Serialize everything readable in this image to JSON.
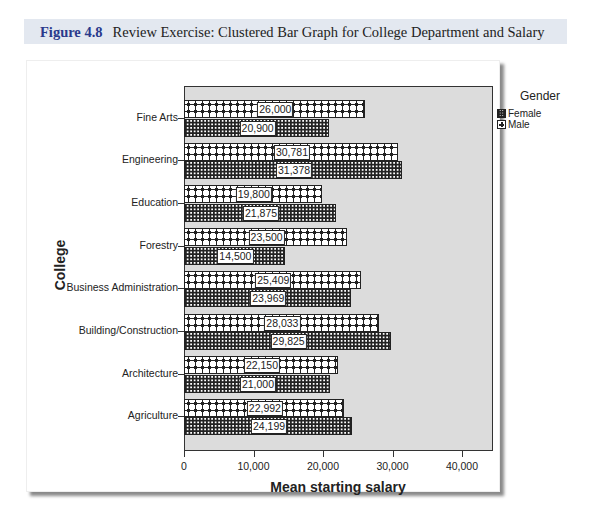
{
  "caption": {
    "figure_label": "Figure 4.8",
    "text": "Review Exercise: Clustered Bar Graph for College Department and Salary"
  },
  "chart_data": {
    "type": "bar",
    "orientation": "horizontal",
    "title": "",
    "xlabel": "Mean starting salary",
    "ylabel": "College",
    "xlim": [
      0,
      44500
    ],
    "x_ticks": [
      "0",
      "10,000",
      "20,000",
      "30,000",
      "40,000"
    ],
    "x_tick_values": [
      0,
      10000,
      20000,
      30000,
      40000
    ],
    "grid": false,
    "legend": {
      "title": "Gender",
      "position": "right",
      "entries": [
        "Female",
        "Male"
      ]
    },
    "categories": [
      "Fine Arts",
      "Engineering",
      "Education",
      "Forestry",
      "Business Administration",
      "Building/Construction",
      "Architecture",
      "Agriculture"
    ],
    "series": [
      {
        "name": "Male",
        "pattern": "cross",
        "values": [
          26000,
          30781,
          19800,
          23500,
          25409,
          28033,
          22150,
          22992
        ],
        "labels": [
          "26,000",
          "30,781",
          "19,800",
          "23,500",
          "25,409",
          "28,033",
          "22,150",
          "22,992"
        ]
      },
      {
        "name": "Female",
        "pattern": "grid",
        "values": [
          20900,
          31378,
          21875,
          14500,
          23969,
          29825,
          21000,
          24199
        ],
        "labels": [
          "20,900",
          "31,378",
          "21,875",
          "14,500",
          "23,969",
          "29,825",
          "21,000",
          "24,199"
        ]
      }
    ]
  },
  "colors": {
    "plot_background": "#dcdcdc",
    "caption_band": "#e3e8f0",
    "caption_label": "#2a3a8c"
  }
}
